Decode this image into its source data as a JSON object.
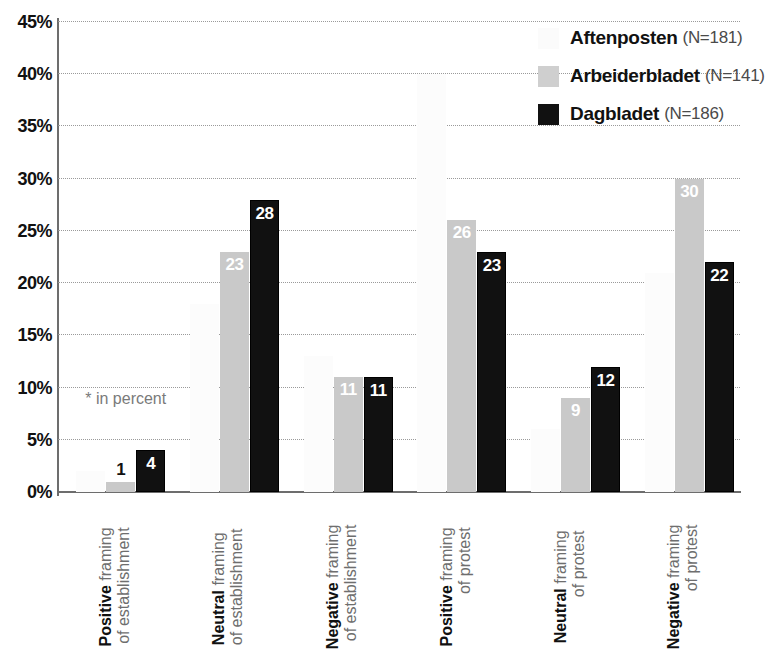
{
  "chart_data": {
    "type": "bar",
    "title": "",
    "subtitle": "",
    "xlabel": "",
    "ylabel": "",
    "ylim": [
      0,
      45
    ],
    "ytick_values": [
      0,
      5,
      10,
      15,
      20,
      25,
      30,
      35,
      40,
      45
    ],
    "ytick_labels": [
      "0%",
      "5%",
      "10%",
      "15%",
      "20%",
      "25%",
      "30%",
      "35%",
      "40%",
      "45%"
    ],
    "grid": "horizontal-dotted",
    "legend_position": "top-right",
    "categories": [
      "Positive framing of establishment",
      "Neutral framing of establishment",
      "Negative framing of establishment",
      "Positive framing of protest",
      "Neutral framing of protest",
      "Negative framing of protest"
    ],
    "category_parts": [
      {
        "bold": "Positive",
        "rest": " framing",
        "line2": "of establishment"
      },
      {
        "bold": "Neutral",
        "rest": " framing",
        "line2": "of establishment"
      },
      {
        "bold": "Negative",
        "rest": " framing",
        "line2": "of establishment"
      },
      {
        "bold": "Positive",
        "rest": " framing",
        "line2": "of protest"
      },
      {
        "bold": "Neutral",
        "rest": " framing",
        "line2": "of protest"
      },
      {
        "bold": "Negative",
        "rest": " framing",
        "line2": "of protest"
      }
    ],
    "series": [
      {
        "name": "Aftenposten",
        "n_label": "(N=181)",
        "color": "#fcfcfc",
        "values": [
          2,
          18,
          13,
          40,
          6,
          21
        ],
        "labels": [
          "",
          "",
          "",
          "",
          "",
          ""
        ]
      },
      {
        "name": "Arbeiderbladet",
        "n_label": "(N=141)",
        "color": "#c9c9c9",
        "values": [
          1,
          23,
          11,
          26,
          9,
          30
        ],
        "labels": [
          "1",
          "23",
          "11",
          "26",
          "9",
          "30"
        ]
      },
      {
        "name": "Dagbladet",
        "n_label": "(N=186)",
        "color": "#111111",
        "values": [
          4,
          28,
          11,
          23,
          12,
          22
        ],
        "labels": [
          "4",
          "28",
          "11",
          "23",
          "12",
          "22"
        ]
      }
    ],
    "annotations": [
      {
        "text": "* in percent",
        "x_pct": 4,
        "y_value": 8
      }
    ]
  },
  "legend": {
    "items": [
      {
        "name": "Aftenposten",
        "n_label": "(N=181)",
        "swatch": "aftenposten"
      },
      {
        "name": "Arbeiderbladet",
        "n_label": "(N=141)",
        "swatch": "arbeiderbladet"
      },
      {
        "name": "Dagbladet",
        "n_label": "(N=186)",
        "swatch": "dagbladet"
      }
    ]
  },
  "footnote": {
    "text": "* in percent"
  }
}
